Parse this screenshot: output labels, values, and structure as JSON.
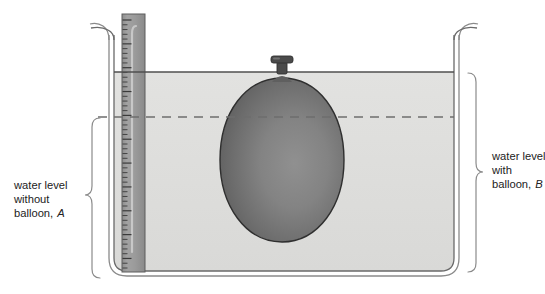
{
  "figure": {
    "background_color": "#ffffff"
  },
  "labels": {
    "left": {
      "name": "water-level-without-balloon",
      "line1": "water level",
      "line2": "without",
      "line3": "balloon,",
      "marker": "A",
      "brace_side": "right-pointing"
    },
    "right": {
      "name": "water-level-with-balloon",
      "line1": "water level",
      "line2": "with",
      "line3": "balloon,",
      "marker": "B",
      "brace_side": "left-pointing"
    }
  },
  "tank": {
    "name": "water-tank",
    "wall_color": "#6e6e6e",
    "inner_left": 113,
    "inner_right": 455,
    "inner_bottom": 272,
    "top": 28
  },
  "water": {
    "name": "water-body",
    "fill_color": "#dededc",
    "surface_y": 72,
    "surface_line_color": "#555555",
    "surface_label": "water level with balloon, B"
  },
  "dashed_level": {
    "name": "water-level-without-balloon-line",
    "y": 117,
    "color": "#6d6d6d",
    "style": "dashed",
    "label": "water level without balloon, A"
  },
  "ruler": {
    "name": "measuring-ruler",
    "x": 122,
    "width": 23,
    "top": 14,
    "bottom": 272,
    "body_color": "#9a9a9a",
    "tick_color": "#3a3a3a",
    "tick_count": 52
  },
  "balloon": {
    "name": "balloon",
    "center_x": 282,
    "center_y": 160,
    "radius_x": 62,
    "radius_y": 82,
    "fill_dark": "#5e5e5e",
    "fill_light": "#8e8e8e",
    "outline_color": "#2e2e2e",
    "nozzle": {
      "name": "balloon-nozzle",
      "color": "#4a4a4a",
      "x": 282,
      "y": 62
    }
  },
  "icons": {
    "brace": "curly-brace-icon",
    "ruler": "ruler-icon",
    "balloon": "balloon-icon",
    "water_surface": "water-surface-line-icon",
    "dashed_line": "dashed-level-line-icon"
  }
}
